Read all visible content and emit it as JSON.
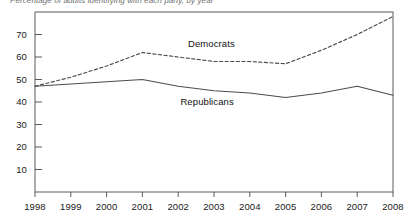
{
  "chart_data": {
    "type": "line",
    "title": "",
    "truncated_caption": "Percentage of adults identifying with each party, by year",
    "xlabel": "",
    "ylabel": "",
    "x": [
      1998,
      1999,
      2000,
      2001,
      2002,
      2003,
      2004,
      2005,
      2006,
      2007,
      2008
    ],
    "xtick_labels": [
      "1998",
      "1999",
      "2000",
      "2001",
      "2002",
      "2003",
      "2004",
      "2005",
      "2006",
      "2007",
      "2008"
    ],
    "ytick_labels": [
      "10",
      "20",
      "30",
      "40",
      "50",
      "60",
      "70"
    ],
    "ytick_values": [
      10,
      20,
      30,
      40,
      50,
      60,
      70
    ],
    "ylim": [
      0,
      80
    ],
    "xlim": [
      1998,
      2008
    ],
    "grid": false,
    "legend_position": "inline-annotation",
    "series": [
      {
        "name": "Democrats",
        "style": "dashed",
        "color": "#4d4d4d",
        "label_x": 2003.0,
        "label_y": 66,
        "values": [
          47,
          51,
          56,
          62,
          60,
          58,
          58,
          57,
          63,
          70,
          78
        ]
      },
      {
        "name": "Republicans",
        "style": "solid",
        "color": "#4d4d4d",
        "label_x": 2002.9,
        "label_y": 40,
        "values": [
          47,
          48,
          49,
          50,
          47,
          45,
          44,
          42,
          44,
          47,
          43
        ]
      }
    ]
  },
  "axes": {
    "plot_left": 35,
    "plot_right": 393,
    "plot_top": 12,
    "plot_bottom": 192
  }
}
